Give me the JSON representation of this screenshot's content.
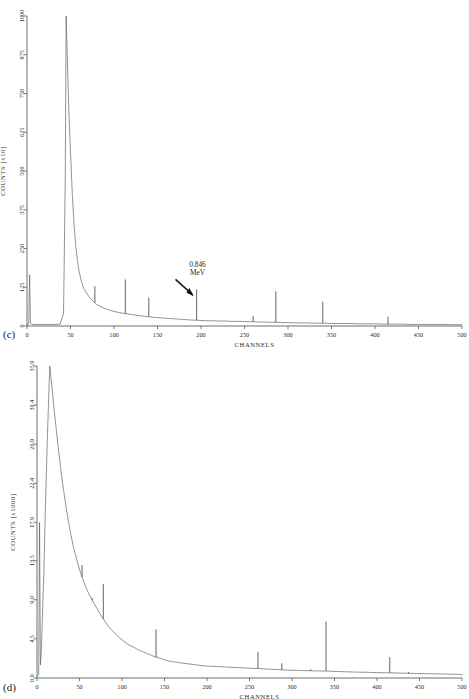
{
  "figure": {
    "panels": [
      {
        "letter": "(c)",
        "ylabel": "COUNTS [x10]",
        "xlabel": "CHANNELS"
      },
      {
        "letter": "(d)",
        "ylabel": "COUNTS [x1000]",
        "xlabel": "CHANNELS"
      }
    ]
  },
  "chart_data": [
    {
      "type": "line",
      "panel": "(c)",
      "title": "",
      "xlabel": "CHANNELS",
      "ylabel": "COUNTS [x10]",
      "xlim": [
        0,
        500
      ],
      "ylim": [
        0,
        1000
      ],
      "xticks": [
        0,
        50,
        100,
        150,
        200,
        250,
        300,
        350,
        400,
        450,
        500
      ],
      "xtick_labels": [
        "0",
        "50",
        "100",
        "150",
        "200",
        "250",
        "300",
        "350",
        "400",
        "450",
        "500"
      ],
      "yticks": [
        0,
        125,
        250,
        375,
        500,
        625,
        750,
        875,
        1000
      ],
      "ytick_labels": [
        "0",
        "125",
        "250",
        "375",
        "500",
        "625",
        "750",
        "875",
        "1000"
      ],
      "grid": false,
      "legend": "none",
      "annotations": [
        {
          "text": "0.846\nMeV",
          "line1": "0.846",
          "line2": "MeV",
          "x": 196,
          "y": 160,
          "arrow_to_x": 193,
          "arrow_to_y": 95
        }
      ],
      "series": [
        {
          "name": "spectrum-c",
          "x": [
            0,
            2,
            3,
            4,
            5,
            6,
            8,
            12,
            18,
            25,
            32,
            38,
            42,
            44,
            45,
            46,
            48,
            50,
            52,
            54,
            56,
            58,
            60,
            62,
            64,
            66,
            68,
            70,
            72,
            74,
            76,
            78,
            80,
            84,
            88,
            92,
            96,
            100,
            105,
            110,
            113,
            116,
            120,
            125,
            130,
            135,
            140,
            145,
            150,
            155,
            160,
            165,
            170,
            175,
            180,
            185,
            190,
            194,
            198,
            205,
            212,
            220,
            228,
            235,
            242,
            250,
            258,
            265,
            272,
            280,
            286,
            292,
            300,
            310,
            320,
            330,
            340,
            345,
            350,
            360,
            370,
            380,
            390,
            400,
            410,
            415,
            420,
            430,
            440,
            450,
            460,
            470,
            480,
            490,
            500
          ],
          "y": [
            5,
            6,
            165,
            8,
            6,
            5,
            5,
            5,
            5,
            5,
            5,
            6,
            40,
            480,
            1000,
            900,
            700,
            560,
            430,
            330,
            260,
            210,
            175,
            150,
            130,
            118,
            108,
            100,
            92,
            86,
            80,
            75,
            70,
            64,
            58,
            54,
            50,
            47,
            44,
            41,
            40,
            39,
            37,
            35,
            33,
            31,
            30,
            28,
            27,
            26,
            25,
            24,
            23,
            22,
            21,
            20,
            19,
            19,
            18,
            17,
            17,
            16,
            16,
            15,
            15,
            14,
            14,
            13,
            13,
            12,
            12,
            11,
            11,
            10,
            10,
            9,
            9,
            9,
            8,
            8,
            8,
            7,
            7,
            7,
            6,
            6,
            6,
            6,
            5,
            5,
            5,
            5,
            5,
            4,
            4
          ]
        }
      ],
      "peaks": [
        {
          "channel": 3,
          "height": 165,
          "label": ""
        },
        {
          "channel": 65,
          "height": 120,
          "label": ""
        },
        {
          "channel": 78,
          "height": 128,
          "label": ""
        },
        {
          "channel": 113,
          "height": 150,
          "label": ""
        },
        {
          "channel": 140,
          "height": 92,
          "label": ""
        },
        {
          "channel": 195,
          "height": 118,
          "label": "0.846 MeV"
        },
        {
          "channel": 260,
          "height": 32,
          "label": ""
        },
        {
          "channel": 286,
          "height": 112,
          "label": ""
        },
        {
          "channel": 340,
          "height": 78,
          "label": ""
        },
        {
          "channel": 415,
          "height": 30,
          "label": ""
        }
      ]
    },
    {
      "type": "line",
      "panel": "(d)",
      "title": "",
      "xlabel": "CHANNELS",
      "ylabel": "COUNTS [x1000]",
      "xlim": [
        0,
        500
      ],
      "ylim": [
        0.0,
        35.9
      ],
      "xticks": [
        0,
        50,
        100,
        150,
        200,
        250,
        300,
        350,
        400,
        450,
        500
      ],
      "xtick_labels": [
        "0",
        "50",
        "100",
        "150",
        "200",
        "250",
        "300",
        "350",
        "400",
        "450",
        "500"
      ],
      "yticks": [
        0.0,
        4.5,
        9.0,
        13.5,
        17.9,
        22.4,
        26.9,
        31.4,
        35.9
      ],
      "ytick_labels": [
        "0.0",
        "4.5",
        "9.0",
        "13.5",
        "17.9",
        "22.4",
        "26.9",
        "31.4",
        "35.9"
      ],
      "grid": false,
      "legend": "none",
      "annotations": [],
      "series": [
        {
          "name": "spectrum-d",
          "x": [
            0,
            2,
            3,
            4,
            5,
            6,
            8,
            10,
            12,
            14,
            15,
            16,
            18,
            20,
            22,
            25,
            28,
            31,
            34,
            37,
            40,
            43,
            46,
            50,
            53,
            56,
            60,
            64,
            67,
            70,
            74,
            78,
            82,
            86,
            90,
            95,
            100,
            105,
            110,
            113,
            118,
            125,
            130,
            133,
            137,
            140,
            144,
            150,
            153,
            158,
            165,
            172,
            180,
            188,
            196,
            205,
            215,
            225,
            235,
            245,
            255,
            260,
            266,
            275,
            285,
            288,
            295,
            305,
            315,
            325,
            335,
            340,
            345,
            352,
            362,
            375,
            390,
            400,
            410,
            415,
            422,
            432,
            445,
            458,
            470,
            482,
            494,
            500
          ],
          "y": [
            0.2,
            0.4,
            17.9,
            1.5,
            3.0,
            6.0,
            12.0,
            20.0,
            27.0,
            33.0,
            35.9,
            35.0,
            33.0,
            31.0,
            29.2,
            26.5,
            24.0,
            21.8,
            19.8,
            18.0,
            16.4,
            15.0,
            13.9,
            12.5,
            11.6,
            10.8,
            9.9,
            9.1,
            8.6,
            8.1,
            7.4,
            6.8,
            6.2,
            5.7,
            5.3,
            4.8,
            4.4,
            4.0,
            3.7,
            3.6,
            3.3,
            3.0,
            2.8,
            2.7,
            2.5,
            2.4,
            2.3,
            2.1,
            2.0,
            1.9,
            1.8,
            1.7,
            1.6,
            1.5,
            1.4,
            1.35,
            1.3,
            1.25,
            1.2,
            1.15,
            1.1,
            1.1,
            1.05,
            1.0,
            0.95,
            0.95,
            0.9,
            0.88,
            0.85,
            0.82,
            0.8,
            0.8,
            0.78,
            0.75,
            0.72,
            0.68,
            0.65,
            0.62,
            0.6,
            0.6,
            0.58,
            0.55,
            0.52,
            0.5,
            0.48,
            0.45,
            0.42,
            0.4
          ]
        }
      ],
      "peaks": [
        {
          "channel": 3,
          "height": 17.9,
          "label": ""
        },
        {
          "channel": 38,
          "height": 15.3,
          "label": ""
        },
        {
          "channel": 53,
          "height": 13.0,
          "label": ""
        },
        {
          "channel": 65,
          "height": 9.2,
          "label": ""
        },
        {
          "channel": 78,
          "height": 10.8,
          "label": ""
        },
        {
          "channel": 113,
          "height": 3.2,
          "label": ""
        },
        {
          "channel": 133,
          "height": 2.6,
          "label": ""
        },
        {
          "channel": 140,
          "height": 5.6,
          "label": ""
        },
        {
          "channel": 153,
          "height": 1.5,
          "label": ""
        },
        {
          "channel": 180,
          "height": 0.9,
          "label": ""
        },
        {
          "channel": 213,
          "height": 0.9,
          "label": ""
        },
        {
          "channel": 235,
          "height": 0.8,
          "label": ""
        },
        {
          "channel": 260,
          "height": 3.0,
          "label": ""
        },
        {
          "channel": 288,
          "height": 1.7,
          "label": ""
        },
        {
          "channel": 322,
          "height": 1.0,
          "label": ""
        },
        {
          "channel": 340,
          "height": 6.5,
          "label": ""
        },
        {
          "channel": 383,
          "height": 0.6,
          "label": ""
        },
        {
          "channel": 415,
          "height": 2.4,
          "label": ""
        },
        {
          "channel": 437,
          "height": 0.7,
          "label": ""
        }
      ]
    }
  ]
}
